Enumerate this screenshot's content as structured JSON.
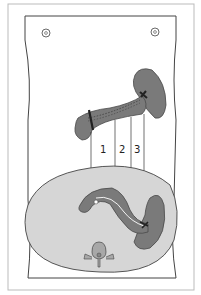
{
  "diagram": {
    "type": "anatomical-illustration",
    "upper_view": "anterior view of pancreas, duodenum area and spleen",
    "lower_view": "transverse cross-section of abdomen with pancreas, spleen and vertebra",
    "labels": [
      {
        "id": "1",
        "text": "1"
      },
      {
        "id": "2",
        "text": "2"
      },
      {
        "id": "3",
        "text": "3"
      }
    ],
    "colors": {
      "organ": "#7a7a7a",
      "organ_outline": "#4a4a4a",
      "body_section": "#d6d6d6",
      "vertebra": "#a8a8a8",
      "line": "#333333"
    }
  }
}
